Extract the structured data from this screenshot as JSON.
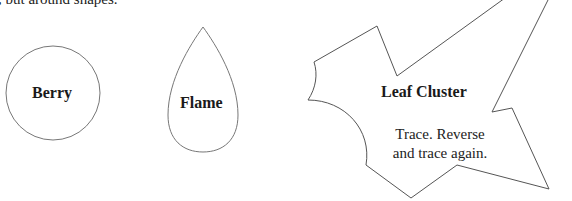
{
  "page": {
    "top_text": ", but around shapes."
  },
  "shapes": [
    {
      "name": "berry",
      "label": "Berry",
      "type": "circle",
      "stroke": "#777777"
    },
    {
      "name": "flame",
      "label": "Flame",
      "type": "teardrop",
      "stroke": "#777777"
    },
    {
      "name": "leaf-cluster",
      "label": "Leaf Cluster",
      "type": "polygon",
      "stroke": "#555555",
      "instructions": [
        "Trace. Reverse",
        "and trace again."
      ]
    }
  ]
}
